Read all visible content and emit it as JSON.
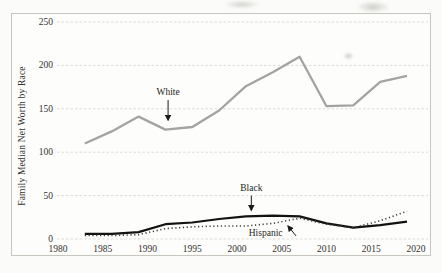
{
  "chart_data": {
    "type": "line",
    "title": "",
    "xlabel": "",
    "ylabel": "Family Median Net Worth by Race",
    "x": [
      1983,
      1986,
      1989,
      1992,
      1995,
      1998,
      2001,
      2004,
      2007,
      2010,
      2013,
      2016,
      2019
    ],
    "series": [
      {
        "name": "White",
        "color": "#a3a3a1",
        "style": "solid",
        "width": 2.3,
        "values": [
          110,
          124,
          141,
          126,
          129,
          148,
          176,
          192,
          210,
          153,
          154,
          181,
          188
        ]
      },
      {
        "name": "Black",
        "color": "#121210",
        "style": "solid",
        "width": 2.2,
        "values": [
          6,
          6,
          8,
          17,
          19,
          23,
          26,
          27,
          26,
          18,
          13,
          16,
          20
        ]
      },
      {
        "name": "Hispanic",
        "color": "#3b3b38",
        "style": "dotted",
        "width": 1.6,
        "values": [
          4,
          4,
          5,
          12,
          14,
          15,
          15,
          18,
          24,
          17,
          13,
          21,
          32
        ]
      }
    ],
    "xticks": [
      1980,
      1985,
      1990,
      1995,
      2000,
      2005,
      2010,
      2015,
      2020
    ],
    "yticks": [
      0,
      50,
      100,
      150,
      200,
      250
    ],
    "xlim": [
      1979.9,
      2021.5
    ],
    "ylim": [
      0,
      250
    ],
    "grid": true,
    "legend": "none (direct line annotations)",
    "annotations": [
      {
        "text": "White",
        "label_x": 1992.3,
        "label_y": 169,
        "arrow_from": [
          1992.3,
          160
        ],
        "arrow_to": [
          1992.3,
          137
        ]
      },
      {
        "text": "Black",
        "label_x": 2001.6,
        "label_y": 59,
        "arrow_from": [
          2001.6,
          50
        ],
        "arrow_to": [
          2001.6,
          33
        ]
      },
      {
        "text": "Hispanic",
        "label_x": 2003.2,
        "label_y": 6.5,
        "arrow_from": [
          2006.6,
          3.5
        ],
        "arrow_to": [
          2005.7,
          15
        ]
      }
    ],
    "grid_color": "#dcdcd5",
    "arrow_color": "#1a1a18"
  }
}
